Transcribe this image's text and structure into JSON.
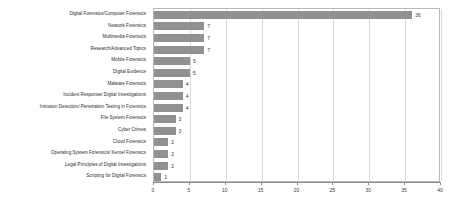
{
  "chart_data": {
    "type": "bar",
    "orientation": "horizontal",
    "title": "",
    "subtitle": "",
    "xlabel": "",
    "ylabel": "",
    "xlim": [
      0,
      40
    ],
    "xticks": [
      0,
      5,
      10,
      15,
      20,
      25,
      30,
      35,
      40
    ],
    "grid": true,
    "grid_axis": "x",
    "legend": false,
    "bar_color": "#919191",
    "grid_color": "#d9d9d9",
    "axis_color": "#8a8a8a",
    "border_color": "#b9b9b9",
    "show_value_labels": true,
    "categories": [
      "Digital Forensics/Computer Forensics",
      "Network Forensics",
      "Multimedia Forensics",
      "Research/Advanced Topics",
      "Mobile Forensics",
      "Digital Evidence",
      "Malware Forensics",
      "Incident Response/ Digital Investigations",
      "Intrusion Detection/ Penetration Testing in Forensics",
      "File System Forensics",
      "Cyber Crimes",
      "Cloud Forensics",
      "Operating System Forensics/ Kernel Forensics",
      "Legal Principles of Digital Investigations",
      "Scripting for Digital Forensics"
    ],
    "values": [
      36,
      7,
      7,
      7,
      5,
      5,
      4,
      4,
      4,
      3,
      3,
      2,
      2,
      2,
      1
    ],
    "value_labels": [
      "36",
      "7",
      "7",
      "7",
      "5",
      "5",
      "4",
      "4",
      "4",
      "3",
      "3",
      "2",
      "2",
      "2",
      "1"
    ],
    "xtick_labels": [
      "0",
      "5",
      "10",
      "15",
      "20",
      "25",
      "30",
      "35",
      "40"
    ]
  }
}
